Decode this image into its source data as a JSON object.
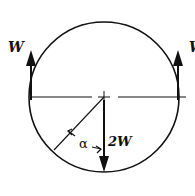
{
  "diagram": {
    "type": "free-body diagram",
    "labels": {
      "left_force": "W",
      "right_force": "W",
      "center_force": "2W",
      "angle": "α"
    },
    "colors": {
      "stroke": "#111111",
      "background": "#ffffff"
    }
  }
}
